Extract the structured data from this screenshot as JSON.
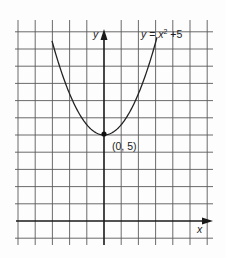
{
  "chart_data": {
    "type": "line",
    "title": "",
    "xlabel": "x",
    "ylabel": "y",
    "equation_label": "y = x² + 5",
    "series": [
      {
        "name": "y = x^2 + 5",
        "function": "x^2 + 5",
        "vertex": [
          0,
          5
        ]
      }
    ],
    "annotations": [
      {
        "text": "(0, 5)",
        "point": [
          0,
          5
        ]
      }
    ],
    "grid": true,
    "x_grid_range": [
      -5,
      6
    ],
    "y_grid_range": [
      -1,
      11
    ]
  }
}
